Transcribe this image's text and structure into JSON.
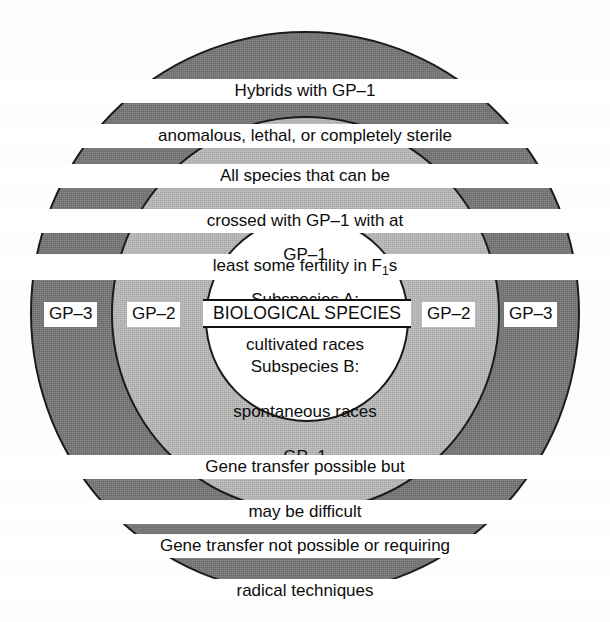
{
  "diagram": {
    "colors": {
      "outer_ring": "#787878",
      "middle_ring": "#bcbcbc",
      "inner_circle": "#ffffff",
      "outline": "#1b1b1b",
      "text": "#0d0d0d"
    },
    "rings": {
      "outer": {
        "name": "GP-3",
        "caption_top_line1": "Hybrids with GP–1",
        "caption_top_line2": "anomalous, lethal, or completely sterile",
        "caption_bottom_line1": "Gene transfer not possible or requiring",
        "caption_bottom_line2": "radical techniques",
        "tag_left": "GP–3",
        "tag_right": "GP–3"
      },
      "middle": {
        "name": "GP-2",
        "caption_top_line1": "All species that can be",
        "caption_top_line2": "crossed with GP–1 with at",
        "caption_top_line3_pre": "least some fertility in F",
        "caption_top_line3_sub": "1",
        "caption_top_line3_post": "s",
        "caption_bottom_line1": "Gene transfer possible but",
        "caption_bottom_line2": "may be difficult",
        "tag_left": "GP–2",
        "tag_right": "GP–2"
      },
      "inner": {
        "name": "GP-1",
        "top_line1": "GP–1",
        "top_line2": "Subspecies A:",
        "top_line3": "cultivated races",
        "band_label": "BIOLOGICAL SPECIES",
        "bottom_line1": "Subspecies B:",
        "bottom_line2": "spontaneous races",
        "bottom_line3": "GP–1"
      }
    }
  }
}
